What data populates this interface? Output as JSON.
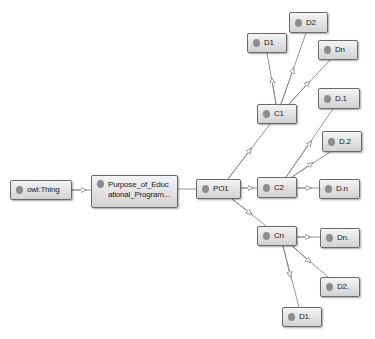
{
  "diagram": {
    "type": "ontology-graph",
    "nodes": [
      {
        "id": "owl_thing",
        "label": "owl:Thing"
      },
      {
        "id": "purpose",
        "label": "Purpose_of_Educ ational_Program..."
      },
      {
        "id": "po1",
        "label": "PO1"
      },
      {
        "id": "c1",
        "label": "C1"
      },
      {
        "id": "c2",
        "label": "C2"
      },
      {
        "id": "cn",
        "label": "Cn"
      },
      {
        "id": "c1_d1",
        "label": "D1"
      },
      {
        "id": "c1_d2",
        "label": "D2"
      },
      {
        "id": "c1_dn",
        "label": "Dn"
      },
      {
        "id": "c2_d1",
        "label": "D.1"
      },
      {
        "id": "c2_d2",
        "label": "D.2"
      },
      {
        "id": "c2_dn",
        "label": "D.n"
      },
      {
        "id": "cn_dn",
        "label": "Dn."
      },
      {
        "id": "cn_d2",
        "label": "D2."
      },
      {
        "id": "cn_d1",
        "label": "D1."
      }
    ],
    "edges": [
      {
        "from": "owl_thing",
        "to": "purpose"
      },
      {
        "from": "purpose",
        "to": "po1"
      },
      {
        "from": "po1",
        "to": "c1"
      },
      {
        "from": "po1",
        "to": "c2"
      },
      {
        "from": "po1",
        "to": "cn"
      },
      {
        "from": "c1",
        "to": "c1_d1"
      },
      {
        "from": "c1",
        "to": "c1_d2"
      },
      {
        "from": "c1",
        "to": "c1_dn"
      },
      {
        "from": "c2",
        "to": "c2_d1"
      },
      {
        "from": "c2",
        "to": "c2_d2"
      },
      {
        "from": "c2",
        "to": "c2_dn"
      },
      {
        "from": "cn",
        "to": "cn_dn"
      },
      {
        "from": "cn",
        "to": "cn_d2"
      },
      {
        "from": "cn",
        "to": "cn_d1"
      }
    ],
    "colors": {
      "node_border": "#6a6a6a",
      "node_fill_top": "#f4f4f4",
      "node_fill_bottom": "#d2d2d2",
      "node_dot": "#8c8c8c",
      "edge": "#8a8a8a",
      "background": "#ffffff"
    }
  }
}
